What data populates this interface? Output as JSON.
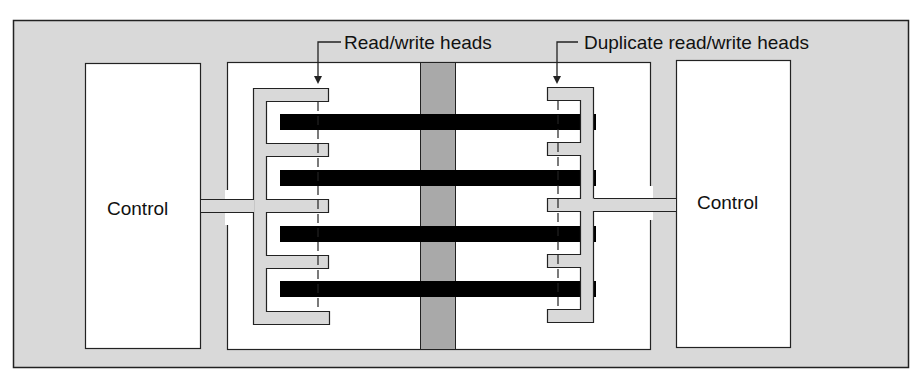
{
  "diagram": {
    "labels": {
      "read_write_heads": "Read/write heads",
      "duplicate_heads": "Duplicate read/write heads",
      "control_left": "Control",
      "control_right": "Control"
    },
    "components": {
      "platters": 4,
      "spindle": "center spindle",
      "head_assemblies": 2
    },
    "colors": {
      "frame_fill": "#d9d9d9",
      "housing_fill": "#ffffff",
      "spindle_fill": "#a9a9a9",
      "platter_fill": "#000000",
      "comb_fill": "#d9d9d9",
      "stroke": "#222222"
    }
  }
}
